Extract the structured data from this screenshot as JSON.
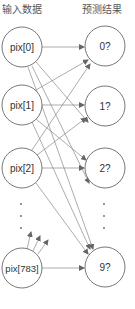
{
  "diagram": {
    "titles": {
      "input": "输入数据",
      "output": "预测结果"
    },
    "colors": {
      "stroke": "#555555",
      "edge": "#777777",
      "text": "#333333",
      "background": "#ffffff"
    },
    "input_nodes": [
      {
        "id": "pix0",
        "label": "pix[0]"
      },
      {
        "id": "pix1",
        "label": "pix[1]"
      },
      {
        "id": "pix2",
        "label": "pix[2]"
      },
      {
        "id": "pix783",
        "label": "pix[783]"
      }
    ],
    "output_nodes": [
      {
        "id": "out0",
        "label": "0?"
      },
      {
        "id": "out1",
        "label": "1?"
      },
      {
        "id": "out2",
        "label": "2?"
      },
      {
        "id": "out9",
        "label": "9?"
      }
    ],
    "ellipsis": "⋮",
    "edges": "fully connected: every input node points to every output node"
  }
}
